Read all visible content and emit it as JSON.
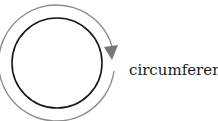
{
  "diagram": {
    "label": "circumference",
    "inner_circle": {
      "cx": 57,
      "cy": 63,
      "r": 45,
      "stroke": "#1a1a1a"
    },
    "outer_arc": {
      "cx": 57,
      "cy": 63,
      "r": 58,
      "stroke": "#8c8c8c"
    },
    "arrowhead": {
      "color": "#7a7a7a",
      "direction": "down"
    }
  }
}
